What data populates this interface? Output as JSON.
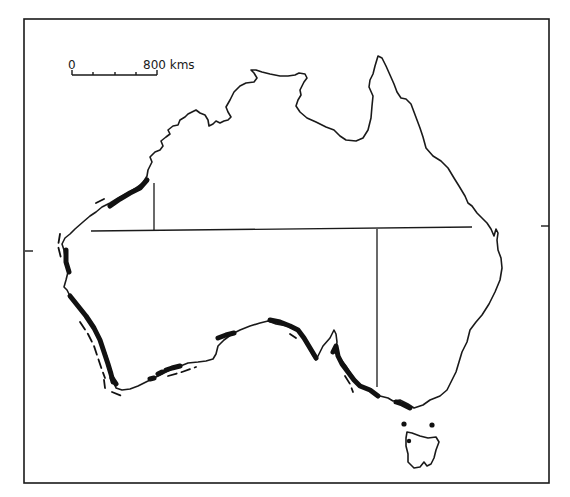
{
  "map": {
    "subject": "Australia outline with state borders",
    "scale": {
      "start_label": "0",
      "end_label": "800 kms",
      "units": "kms",
      "length_value": 800
    },
    "legend_styles": {
      "coastline": "thin solid line",
      "highlighted_coast": "thick solid line",
      "offshore": "dashed line"
    },
    "frame_ticks": [
      "left",
      "right"
    ],
    "colors": {
      "ink": "#1a1a1a",
      "background": "#ffffff"
    }
  }
}
